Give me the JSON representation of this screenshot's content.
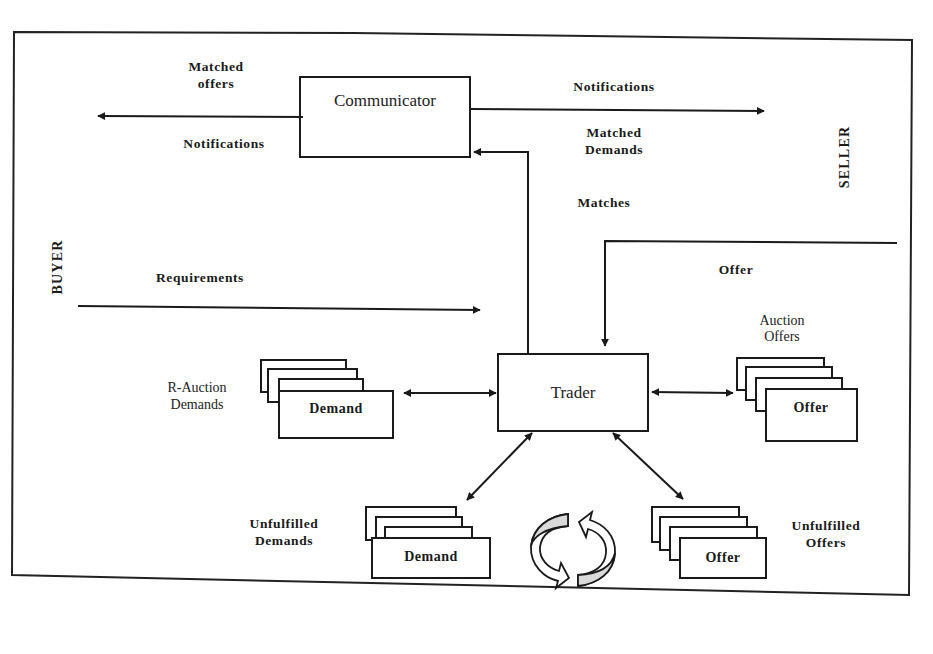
{
  "diagram": {
    "actors": {
      "buyer": "BUYER",
      "seller": "SELLER"
    },
    "components": {
      "communicator": "Communicator",
      "trader": "Trader"
    },
    "flows": {
      "matched_offers_line1": "Matched",
      "matched_offers_line2": "offers",
      "notifications_left": "Notifications",
      "notifications_right": "Notifications",
      "matched_demands_line1": "Matched",
      "matched_demands_line2": "Demands",
      "matches": "Matches",
      "requirements": "Requirements",
      "offer": "Offer"
    },
    "stores": {
      "r_auction_demands": {
        "caption_line1": "R-Auction",
        "caption_line2": "Demands",
        "card_label": "Demand"
      },
      "auction_offers": {
        "caption_line1": "Auction",
        "caption_line2": "Offers",
        "card_label": "Offer"
      },
      "unfulfilled_demands": {
        "caption_line1": "Unfulfilled",
        "caption_line2": "Demands",
        "card_label": "Demand"
      },
      "unfulfilled_offers": {
        "caption_line1": "Unfulfilled",
        "caption_line2": "Offers",
        "card_label": "Offer"
      }
    },
    "cycle_icon": "refresh-cycle-icon",
    "colors": {
      "stroke": "#1a1a1a",
      "background": "#ffffff",
      "cycle_fill": "#d9d9d9"
    }
  }
}
